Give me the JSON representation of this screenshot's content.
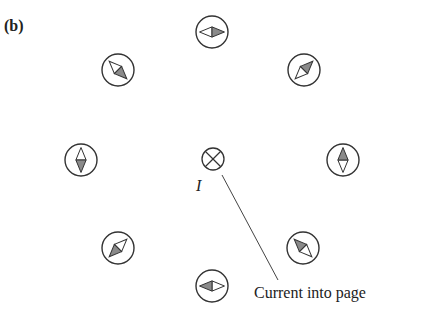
{
  "figure": {
    "panel_label": "(b)",
    "current": {
      "symbol": "I",
      "direction": "into page",
      "marker": "cross-in-circle",
      "center": [
        213,
        159
      ],
      "radius": 11
    },
    "callout": {
      "text": "Current into page",
      "line_from": [
        222,
        175
      ],
      "line_to": [
        278,
        280
      ]
    },
    "colors": {
      "stroke": "#333333",
      "needle_shaded": "#8a8a8a",
      "needle_white": "#ffffff",
      "background": "#ffffff"
    },
    "compasses": [
      {
        "id": "top",
        "cx": 212,
        "cy": 32,
        "r": 16,
        "north_angle_deg": 0
      },
      {
        "id": "upper-right",
        "cx": 304,
        "cy": 70,
        "r": 16,
        "north_angle_deg": -45
      },
      {
        "id": "right",
        "cx": 343,
        "cy": 160,
        "r": 16,
        "north_angle_deg": -90
      },
      {
        "id": "lower-right",
        "cx": 303,
        "cy": 248,
        "r": 16,
        "north_angle_deg": -135
      },
      {
        "id": "bottom",
        "cx": 212,
        "cy": 286,
        "r": 16,
        "north_angle_deg": 180
      },
      {
        "id": "lower-left",
        "cx": 118,
        "cy": 248,
        "r": 16,
        "north_angle_deg": 135
      },
      {
        "id": "left",
        "cx": 81,
        "cy": 160,
        "r": 16,
        "north_angle_deg": 90
      },
      {
        "id": "upper-left",
        "cx": 118,
        "cy": 70,
        "r": 16,
        "north_angle_deg": 45
      }
    ]
  }
}
